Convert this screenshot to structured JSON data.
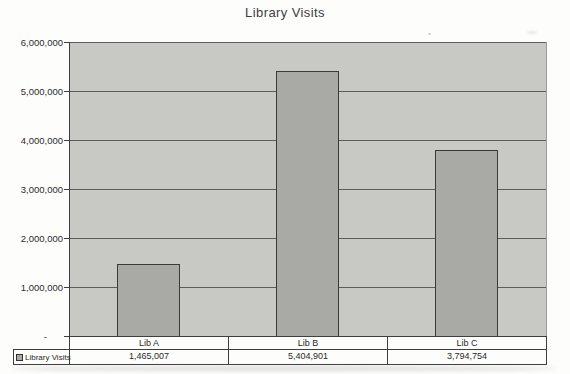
{
  "title": "Library Visits",
  "legend": {
    "label": "Library Visits",
    "key_icon": "legend-key-square"
  },
  "colors": {
    "page_bg": "#fdfdfb",
    "plot_bg": "#c8c8c5",
    "bar_fill": "#a9a9a5",
    "bar_border": "#3a3a3a",
    "gridline": "#5c5c5c",
    "table_border": "#3f3f3f",
    "text": "#2e2e2e"
  },
  "chart_data": {
    "type": "bar",
    "title": "Library Visits",
    "categories": [
      "Lib A",
      "Lib B",
      "Lib C"
    ],
    "series": [
      {
        "name": "Library Visits",
        "values": [
          1465007,
          5404901,
          3794754
        ]
      }
    ],
    "value_labels": [
      "1,465,007",
      "5,404,901",
      "3,794,754"
    ],
    "ylim": [
      0,
      6000000
    ],
    "ytick_interval": 1000000,
    "yticks": [
      "6,000,000",
      "5,000,000",
      "4,000,000",
      "3,000,000",
      "2,000,000",
      "1,000,000",
      "-"
    ],
    "grid": "horizontal",
    "legend_position": "bottom-left-table",
    "has_data_table": true
  }
}
